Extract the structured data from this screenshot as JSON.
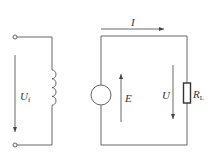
{
  "diagram": {
    "type": "circuit",
    "left_circuit": {
      "voltage_label": "U",
      "voltage_subscript": "f",
      "components": [
        "terminal-top",
        "terminal-bottom",
        "inductor-coil"
      ],
      "voltage_arrow_direction": "down"
    },
    "right_circuit": {
      "current_label": "I",
      "current_arrow_direction": "right",
      "source_label": "E",
      "source_arrow_direction": "up",
      "load_voltage_label": "U",
      "load_voltage_arrow_direction": "down",
      "resistor_label": "R",
      "resistor_subscript": "L",
      "components": [
        "voltage-source",
        "load-resistor"
      ]
    },
    "colors": {
      "line": "#555555",
      "text": "#333333",
      "background": "#ffffff"
    }
  }
}
